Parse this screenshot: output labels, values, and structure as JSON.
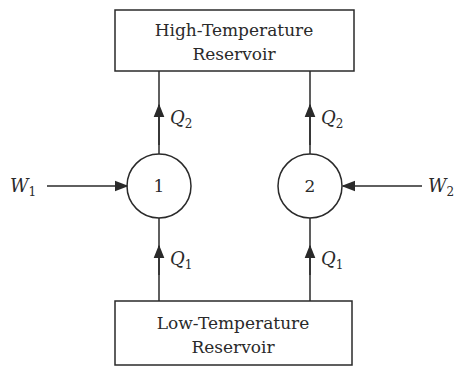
{
  "diagram": {
    "type": "heat-pump / heat-engine reservoir diagram",
    "high_reservoir": {
      "line1": "High-Temperature",
      "line2": "Reservoir"
    },
    "low_reservoir": {
      "line1": "Low-Temperature",
      "line2": "Reservoir"
    },
    "devices": [
      {
        "id": "1",
        "label": "1",
        "work": {
          "symbol": "W",
          "subscript": "1",
          "direction": "in-from-left"
        },
        "heat_in": {
          "symbol": "Q",
          "subscript": "1",
          "from": "Low-Temperature Reservoir"
        },
        "heat_out": {
          "symbol": "Q",
          "subscript": "2",
          "to": "High-Temperature Reservoir"
        }
      },
      {
        "id": "2",
        "label": "2",
        "work": {
          "symbol": "W",
          "subscript": "2",
          "direction": "in-from-right"
        },
        "heat_in": {
          "symbol": "Q",
          "subscript": "1",
          "from": "Low-Temperature Reservoir"
        },
        "heat_out": {
          "symbol": "Q",
          "subscript": "2",
          "to": "High-Temperature Reservoir"
        }
      }
    ],
    "colors": {
      "stroke": "#2a2a2a",
      "background": "#ffffff"
    }
  }
}
